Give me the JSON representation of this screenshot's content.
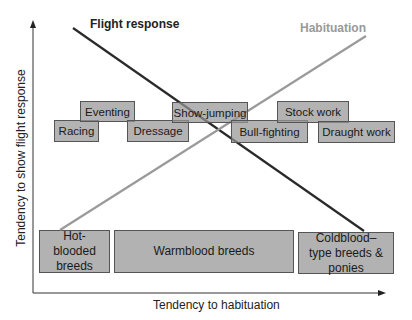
{
  "diagram": {
    "title_flight": "Flight response",
    "title_habituation": "Habituation",
    "x_axis_label": "Tendency to habituation",
    "y_axis_label": "Tendency to show flight response",
    "colors": {
      "flight_line": "#2a2a2a",
      "habituation_line": "#9a9a9a",
      "box_fill": "#a0a0a0",
      "box_border": "#555555",
      "axis": "#333333"
    },
    "activities": [
      {
        "label": "Racing"
      },
      {
        "label": "Eventing"
      },
      {
        "label": "Dressage"
      },
      {
        "label": "Show-jumping"
      },
      {
        "label": "Bull-fighting"
      },
      {
        "label": "Stock work"
      },
      {
        "label": "Draught work"
      }
    ],
    "breeds": [
      {
        "label": "Hot-blooded breeds"
      },
      {
        "label": "Warmblood breeds"
      },
      {
        "label": "Coldblood–type breeds & ponies"
      }
    ],
    "lines": [
      {
        "name": "Flight response",
        "from": "high flight / hot-blooded",
        "to": "low flight / coldblood",
        "trend": "decreasing"
      },
      {
        "name": "Habituation",
        "from": "low habituation / hot-blooded",
        "to": "high habituation / coldblood",
        "trend": "increasing"
      }
    ]
  }
}
